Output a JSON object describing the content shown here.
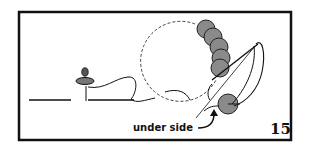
{
  "figure": {
    "label_under_side": "under side",
    "figure_number": "15",
    "colors": {
      "ink": "#111111",
      "sequin": "#8a8a8a",
      "background": "#ffffff"
    }
  }
}
